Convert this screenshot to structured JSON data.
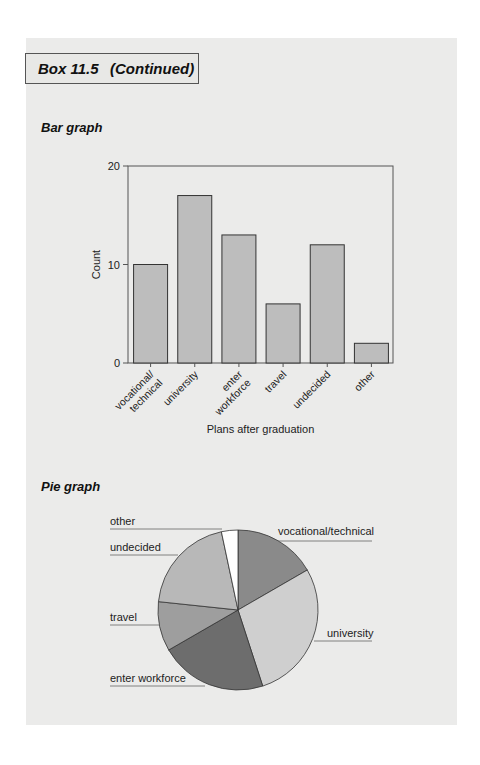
{
  "header": {
    "box_label": "Box 11.5",
    "continued": "(Continued)"
  },
  "sections": {
    "bar_title": "Bar graph",
    "pie_title": "Pie graph"
  },
  "chart_data": [
    {
      "type": "bar",
      "title": "Bar graph",
      "categories": [
        "vocational/technical",
        "university",
        "enter workforce",
        "travel",
        "undecided",
        "other"
      ],
      "category_labels": [
        [
          "vocational/",
          "technical"
        ],
        [
          "university"
        ],
        [
          "enter",
          "workforce"
        ],
        [
          "travel"
        ],
        [
          "undecided"
        ],
        [
          "other"
        ]
      ],
      "values": [
        10,
        17,
        13,
        6,
        12,
        2
      ],
      "xlabel": "Plans after graduation",
      "ylabel": "Count",
      "ylim": [
        0,
        20
      ],
      "yticks": [
        0,
        10,
        20
      ],
      "grid": false,
      "bar_color": "#bdbdbd"
    },
    {
      "type": "pie",
      "title": "Pie graph",
      "categories": [
        "vocational/technical",
        "university",
        "enter workforce",
        "travel",
        "undecided",
        "other"
      ],
      "values": [
        10,
        17,
        13,
        6,
        12,
        2
      ],
      "colors": [
        "#8a8a8a",
        "#cfcfcf",
        "#6d6d6d",
        "#9e9e9e",
        "#b8b8b8",
        "#ffffff"
      ],
      "start_angle": "12 o'clock, clockwise",
      "legend": "leader-line labels"
    }
  ]
}
